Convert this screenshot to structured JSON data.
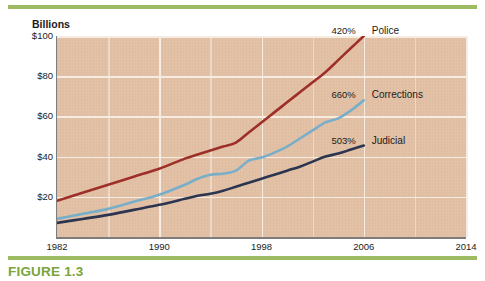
{
  "caption": "FIGURE 1.3",
  "axis_title": "Billions",
  "accent_green": "#9cbb63",
  "caption_green": "#7aa43a",
  "plot_background": "#e2c0a5",
  "gridline_color": "#f6ece2",
  "chart_data": {
    "type": "line",
    "title": "",
    "subtitle": "",
    "xlabel": "",
    "ylabel": "Billions",
    "xlim": [
      1982,
      2014
    ],
    "ylim": [
      0,
      100
    ],
    "grid": true,
    "legend_position": "inline-right",
    "x_tick_labels": [
      "1982",
      "1990",
      "1998",
      "2006",
      "2014"
    ],
    "x_ticks": [
      1982,
      1990,
      1998,
      2006,
      2014
    ],
    "y_tick_labels": [
      "$20",
      "$40",
      "$60",
      "$80",
      "$100"
    ],
    "y_ticks": [
      20,
      40,
      60,
      80,
      100
    ],
    "x": [
      1982,
      1984,
      1986,
      1988,
      1990,
      1992,
      1993,
      1994,
      1995,
      1996,
      1997,
      1998,
      1999,
      2000,
      2001,
      2002,
      2003,
      2004,
      2005,
      2006
    ],
    "series": [
      {
        "name": "Police",
        "color": "#9e2f28",
        "growth_label": "420%",
        "values": [
          18,
          22,
          26,
          30,
          34,
          39,
          41,
          43,
          45,
          47,
          52,
          57,
          62,
          67,
          72,
          77,
          82,
          88,
          94,
          100
        ]
      },
      {
        "name": "Corrections",
        "color": "#79aec9",
        "growth_label": "660%",
        "values": [
          9,
          11.5,
          14,
          17.5,
          21,
          26,
          29,
          31,
          31.5,
          33,
          38,
          39.5,
          42,
          45,
          49,
          53,
          57,
          59,
          63,
          68
        ]
      },
      {
        "name": "Judicial",
        "color": "#2b3550",
        "growth_label": "503%",
        "values": [
          7,
          9,
          11,
          13.5,
          16,
          19,
          20.5,
          21.5,
          23,
          25,
          27,
          29,
          31,
          33,
          35,
          37.5,
          40,
          41.5,
          43.5,
          45.5
        ]
      }
    ]
  }
}
